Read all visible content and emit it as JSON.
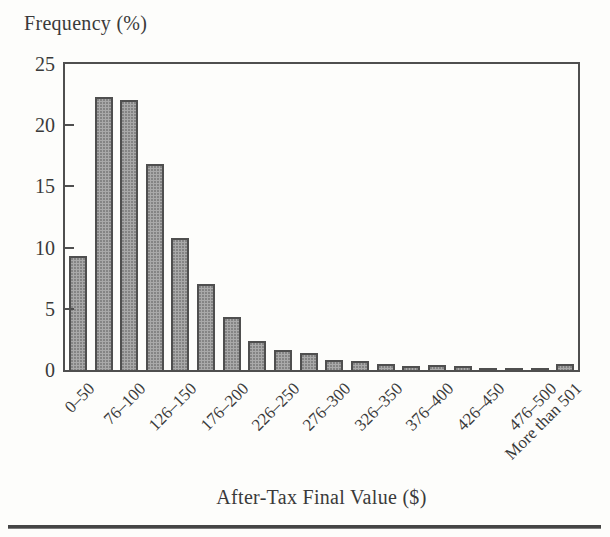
{
  "figure": {
    "kind": "scanned-book-histogram"
  },
  "chart_data": {
    "type": "bar",
    "title": "",
    "ylabel": "Frequency (%)",
    "xlabel": "After-Tax Final Value ($)",
    "ylim": [
      0,
      25
    ],
    "y_ticks": [
      0,
      5,
      10,
      15,
      20,
      25
    ],
    "grid": false,
    "legend": "none",
    "bar_fill": "#a9a9a9",
    "bar_border": "#4f4f4f",
    "frame_color": "#4f4f4f",
    "text_color": "#3a3a3a",
    "divider_color": "#454545",
    "categories": [
      "0–50",
      "51–75",
      "76–100",
      "101–125",
      "126–150",
      "151–175",
      "176–200",
      "201–225",
      "226–250",
      "251–275",
      "276–300",
      "301–325",
      "326–350",
      "351–375",
      "376–400",
      "401–425",
      "426–450",
      "451–475",
      "476–500",
      "More than 501"
    ],
    "values": [
      9.3,
      22.3,
      22.1,
      16.8,
      10.8,
      7.0,
      4.3,
      2.4,
      1.6,
      1.4,
      0.8,
      0.7,
      0.5,
      0.3,
      0.4,
      0.3,
      0.1,
      0.1,
      0.1,
      0.5
    ],
    "labeled_category_indices": [
      0,
      2,
      4,
      6,
      8,
      10,
      12,
      14,
      16,
      18,
      19
    ],
    "x_tick_labels_shown": [
      "0–50",
      "76–100",
      "126–150",
      "176–200",
      "226–250",
      "276–300",
      "326–350",
      "376–400",
      "426–450",
      "476–500",
      "More than 501"
    ],
    "x_tick_label_rotation_deg": -45
  }
}
